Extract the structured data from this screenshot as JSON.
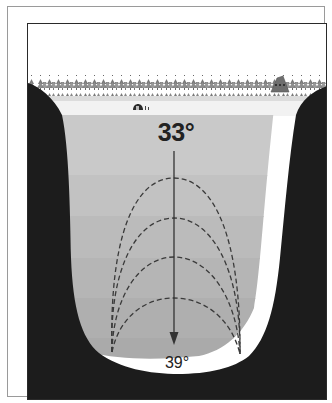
{
  "diagram": {
    "surface_temperature": "33°",
    "bottom_temperature": "39°",
    "elements": {
      "surface": "snow-covered frozen surface",
      "treeline": "forest of conifer trees",
      "cabin": "A-frame cabin",
      "ice_fishing_hut": "small ice-fishing shelter",
      "arrow": "downward arrow indicating increasing temperature with depth",
      "convection_arcs": 4
    },
    "colors": {
      "frame": "#2a2a2a",
      "shore": "#1c1c1c",
      "snow": "#f2f2f2",
      "tree": "#6a6a6a",
      "water_bands": [
        "#c9c9c9",
        "#c2c2c2",
        "#bbbbbb",
        "#b5b5b5",
        "#afafaf",
        "#aaaaaa"
      ],
      "arrow": "#333333",
      "dashes": "#3a3a3a"
    }
  }
}
